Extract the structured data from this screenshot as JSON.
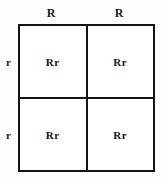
{
  "diagram": {
    "type": "punnett-square",
    "title": "",
    "grid_size": "2x2",
    "colors": {
      "border": "#141414",
      "cell_background": "#ffffff",
      "page_background": "#fefefe",
      "text": "#1a1a1a"
    },
    "column_headers": [
      {
        "label": "R"
      },
      {
        "label": "R"
      }
    ],
    "row_headers": [
      {
        "label": "r"
      },
      {
        "label": "r"
      }
    ],
    "cells": [
      [
        {
          "genotype": "Rr"
        },
        {
          "genotype": "Rr"
        }
      ],
      [
        {
          "genotype": "Rr"
        },
        {
          "genotype": "Rr"
        }
      ]
    ]
  }
}
